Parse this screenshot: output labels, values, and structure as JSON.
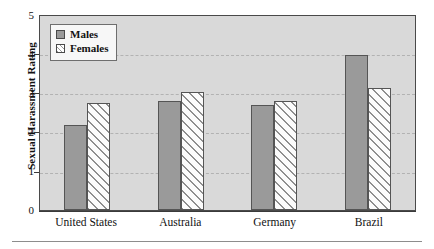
{
  "chart_data": {
    "type": "bar",
    "title": "",
    "xlabel": "",
    "ylabel": "Sexual Harassment Rating",
    "categories": [
      "United States",
      "Australia",
      "Germany",
      "Brazil"
    ],
    "series": [
      {
        "name": "Males",
        "values": [
          2.2,
          2.8,
          2.7,
          4.0
        ],
        "color": "#9a9a9a",
        "fill": "solid-gray"
      },
      {
        "name": "Females",
        "values": [
          2.75,
          3.05,
          2.8,
          3.15
        ],
        "color": "#ffffff",
        "fill": "diagonal-hatch"
      }
    ],
    "ylim": [
      0,
      5
    ],
    "yticks": [
      "0",
      "1",
      "2",
      "3",
      "4",
      "5"
    ],
    "grid": "horizontal-dashed",
    "gridlines_at": [
      1,
      2,
      3,
      4
    ],
    "legend_position": "top-left-inside",
    "plot_background": "#d9d9d9",
    "plot_border": "#4a4a4a"
  },
  "legend": {
    "items": [
      {
        "label": "Males"
      },
      {
        "label": "Females"
      }
    ]
  },
  "axes": {
    "y_title": "Sexual Harassment Rating",
    "y_ticks": [
      "5",
      "4",
      "3",
      "2",
      "1",
      "0"
    ],
    "x_categories": [
      "United States",
      "Australia",
      "Germany",
      "Brazil"
    ]
  }
}
